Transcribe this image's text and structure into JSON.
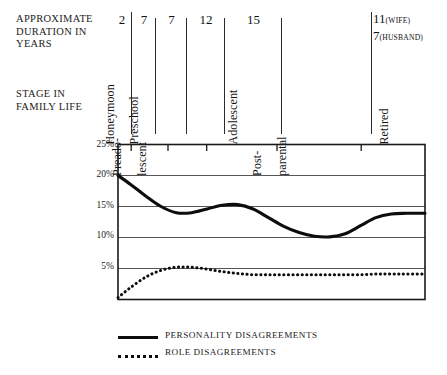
{
  "header": {
    "duration_label": "APPROXIMATE\nDURATION IN\nYEARS",
    "stage_label": "STAGE IN\nFAMILY LIFE"
  },
  "stages": [
    {
      "name": "Honeymoon",
      "duration": "2",
      "lines": [
        "Honeymoon"
      ]
    },
    {
      "name": "Preschool",
      "duration": "7",
      "lines": [
        "Preschool"
      ]
    },
    {
      "name": "Preadolescent",
      "duration": "7",
      "lines": [
        "Preado-",
        "lescent"
      ]
    },
    {
      "name": "Adolescent",
      "duration": "12",
      "lines": [
        "Adolescent"
      ]
    },
    {
      "name": "Post-parental",
      "duration": "15",
      "lines": [
        "Post-",
        "parental"
      ]
    },
    {
      "name": "Retired",
      "duration": "11",
      "lines": [
        "Retired"
      ]
    }
  ],
  "retired_duration": {
    "wife_value": "11",
    "wife_note": "(WIFE)",
    "husband_value": "7",
    "husband_note": "(HUSBAND)"
  },
  "legend": [
    {
      "label": "PERSONALITY DISAGREEMENTS",
      "style": "solid"
    },
    {
      "label": "ROLE DISAGREEMENTS",
      "style": "dotted"
    }
  ],
  "colors": {
    "line": "#0d0d0d",
    "grid": "#4d4d4d",
    "axis": "#1a1a1a",
    "text": "#1a1a1a",
    "background": "#ffffff"
  },
  "chart_data": {
    "type": "line",
    "title": "",
    "xlabel": "STAGE IN FAMILY LIFE",
    "ylabel": "",
    "ylim": [
      0,
      25
    ],
    "yticks": [
      5,
      10,
      15,
      20,
      25
    ],
    "ytick_labels": [
      "5%",
      "10%",
      "15%",
      "20%",
      "25%"
    ],
    "grid": true,
    "legend_position": "bottom",
    "x_categories": [
      "Honeymoon",
      "Preschool",
      "Preadolescent",
      "Adolescent",
      "Post-parental",
      "Retired"
    ],
    "x_boundaries_pct": [
      0,
      4.3,
      16.3,
      28.9,
      51.8,
      79.2,
      100
    ],
    "series": [
      {
        "name": "PERSONALITY DISAGREEMENTS",
        "style": "solid",
        "x": [
          0,
          4,
          9,
          14,
          19,
          24,
          29,
          34,
          39,
          44,
          49,
          54,
          59,
          64,
          69,
          74,
          79,
          84,
          89,
          94,
          100
        ],
        "values": [
          20.0,
          18.6,
          16.7,
          15.0,
          14.0,
          14.0,
          14.6,
          15.2,
          15.3,
          14.6,
          13.2,
          11.8,
          10.8,
          10.2,
          10.1,
          10.6,
          11.9,
          13.2,
          13.8,
          13.9,
          13.9
        ]
      },
      {
        "name": "ROLE DISAGREEMENTS",
        "style": "dotted",
        "x": [
          0,
          4,
          9,
          14,
          19,
          24,
          29,
          34,
          39,
          44,
          49,
          54,
          59,
          64,
          69,
          74,
          79,
          84,
          89,
          94,
          100
        ],
        "values": [
          0.3,
          1.9,
          3.6,
          4.7,
          5.2,
          5.2,
          4.9,
          4.5,
          4.2,
          4.0,
          4.0,
          4.0,
          4.0,
          4.0,
          4.0,
          4.0,
          4.0,
          4.1,
          4.1,
          4.1,
          4.1
        ]
      }
    ]
  }
}
